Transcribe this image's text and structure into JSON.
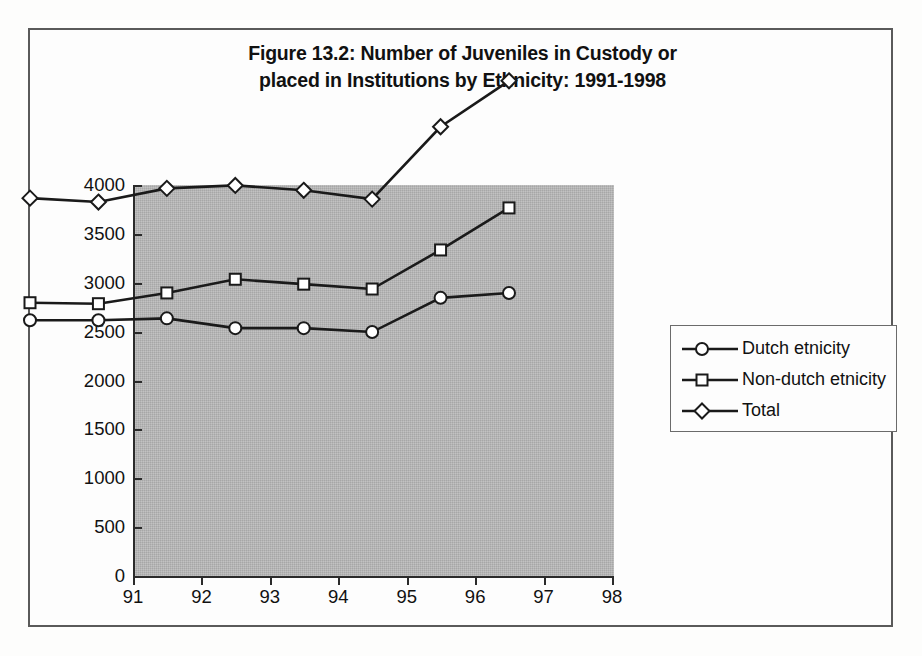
{
  "figure": {
    "title_line1": "Figure 13.2: Number of Juveniles in Custody or",
    "title_line2": "placed in Institutions by Ethnicity: 1991-1998"
  },
  "chart_data": {
    "type": "line",
    "title": "Figure 13.2: Number of Juveniles in Custody or placed in Institutions by Ethnicity: 1991-1998",
    "xlabel": "",
    "ylabel": "",
    "categories": [
      "91",
      "92",
      "93",
      "94",
      "95",
      "96",
      "97",
      "98"
    ],
    "series": [
      {
        "name": "Dutch etnicity",
        "marker": "circle",
        "values": [
          1030,
          1030,
          1050,
          950,
          950,
          910,
          1260,
          1310
        ]
      },
      {
        "name": "Non-dutch etnicity",
        "marker": "square",
        "values": [
          1210,
          1200,
          1310,
          1450,
          1400,
          1350,
          1750,
          2180
        ]
      },
      {
        "name": "Total",
        "marker": "diamond",
        "values": [
          2280,
          2240,
          2380,
          2410,
          2360,
          2270,
          3010,
          3480
        ]
      }
    ],
    "ylim": [
      0,
      4000
    ],
    "yticks": [
      0,
      500,
      1000,
      1500,
      2000,
      2500,
      3000,
      3500,
      4000
    ],
    "ytick_labels": [
      "0",
      "500",
      "1000",
      "1500",
      "2000",
      "2500",
      "3000",
      "3500",
      "4000"
    ],
    "grid": false,
    "legend_position": "right",
    "plot_background": "#b3b3b3",
    "line_color": "#1a1a1a",
    "marker_fill": "#ffffff"
  },
  "legend": {
    "items": [
      {
        "label": "Dutch etnicity",
        "marker": "circle"
      },
      {
        "label": "Non-dutch etnicity",
        "marker": "square"
      },
      {
        "label": "Total",
        "marker": "diamond"
      }
    ]
  }
}
